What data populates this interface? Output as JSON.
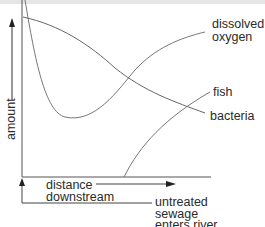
{
  "diagram": {
    "y_axis_label": "amount",
    "x_axis_label_line1": "distance",
    "x_axis_label_line2": "downstream",
    "event_label_line1": "untreated",
    "event_label_line2": "sewage",
    "event_label_line3": "enters river",
    "curves": [
      {
        "name": "dissolved oxygen",
        "label_line1": "dissolved",
        "label_line2": "oxygen",
        "trend": "drops sharply after sewage enters, minimum, then recovers"
      },
      {
        "name": "bacteria",
        "label": "bacteria",
        "trend": "high at sewage entry, decreases downstream"
      },
      {
        "name": "fish",
        "label": "fish",
        "trend": "absent initially, rises once oxygen recovers"
      }
    ],
    "colors": {
      "line": "#6e6e6e",
      "text": "#2a2a2a",
      "topbar": "#e6e6e6"
    }
  }
}
